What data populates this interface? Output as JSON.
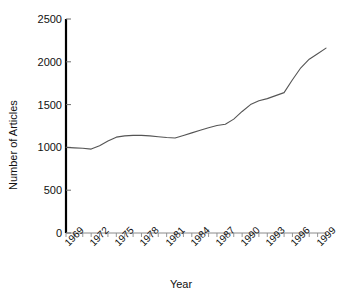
{
  "chart_data": {
    "type": "line",
    "title": "",
    "xlabel": "Year",
    "ylabel": "Number of Articles",
    "xlim": [
      1969,
      2000
    ],
    "ylim": [
      0,
      2500
    ],
    "yticks": [
      0,
      500,
      1000,
      1500,
      2000,
      2500
    ],
    "ytick_labels": [
      "0",
      "500",
      "1000",
      "1500",
      "2000",
      "2500"
    ],
    "xtick_labels": [
      "1969",
      "1972",
      "1975",
      "1978",
      "1981",
      "1984",
      "1987",
      "1990",
      "1993",
      "1996",
      "1999"
    ],
    "xtick_values": [
      1969,
      1972,
      1975,
      1978,
      1981,
      1984,
      1987,
      1990,
      1993,
      1996,
      1999
    ],
    "xtick_label_rotation": -45,
    "grid": false,
    "legend": null,
    "line_color": "#555555",
    "axis_color": "#000000",
    "x": [
      1969,
      1970,
      1971,
      1972,
      1973,
      1974,
      1975,
      1976,
      1977,
      1978,
      1979,
      1980,
      1981,
      1982,
      1983,
      1984,
      1985,
      1986,
      1987,
      1988,
      1989,
      1990,
      1991,
      1992,
      1993,
      1994,
      1995,
      1996,
      1997,
      1998,
      1999,
      2000
    ],
    "values": [
      1000,
      995,
      990,
      980,
      1020,
      1075,
      1120,
      1135,
      1140,
      1140,
      1135,
      1125,
      1115,
      1110,
      1140,
      1170,
      1200,
      1230,
      1255,
      1270,
      1330,
      1420,
      1500,
      1545,
      1570,
      1605,
      1640,
      1790,
      1930,
      2030,
      2095,
      2160
    ],
    "series_name": "Number of Articles"
  }
}
